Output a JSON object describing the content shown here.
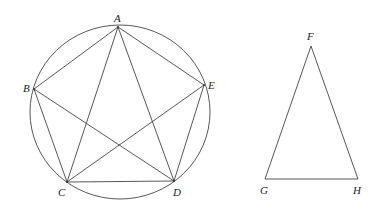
{
  "figure": {
    "circle": {
      "cx": 120,
      "cy": 112,
      "rx": 90,
      "ry": 87
    },
    "pentagon_points": {
      "A": {
        "label": "A",
        "x": 118,
        "y": 27,
        "lx": 114,
        "ly": 22
      },
      "B": {
        "label": "B",
        "x": 34,
        "y": 89,
        "lx": 23,
        "ly": 91
      },
      "C": {
        "label": "C",
        "x": 67,
        "y": 182,
        "lx": 58,
        "ly": 195
      },
      "D": {
        "label": "D",
        "x": 174,
        "y": 181,
        "lx": 173,
        "ly": 195
      },
      "E": {
        "label": "E",
        "x": 204,
        "y": 85,
        "lx": 208,
        "ly": 89
      }
    },
    "triangle_points": {
      "F": {
        "label": "F",
        "x": 311,
        "y": 46,
        "lx": 307,
        "ly": 39
      },
      "G": {
        "label": "G",
        "x": 265,
        "y": 179,
        "lx": 260,
        "ly": 193
      },
      "H": {
        "label": "H",
        "x": 358,
        "y": 179,
        "lx": 354,
        "ly": 193
      }
    },
    "stroke_color": "#444444"
  }
}
